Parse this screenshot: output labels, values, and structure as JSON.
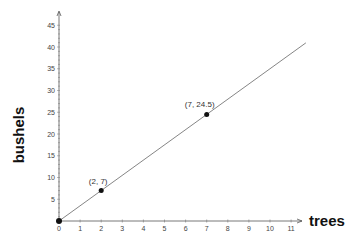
{
  "chart_data": {
    "type": "line",
    "title": "",
    "xlabel": "trees",
    "ylabel": "bushels",
    "xlim": [
      0,
      11.7
    ],
    "ylim": [
      0,
      46
    ],
    "x_ticks": [
      0,
      1,
      2,
      3,
      4,
      5,
      6,
      7,
      8,
      9,
      10,
      11
    ],
    "y_ticks": [
      5,
      10,
      15,
      20,
      25,
      30,
      35,
      40,
      45
    ],
    "grid": false,
    "series": [
      {
        "name": "bushels vs trees",
        "x": [
          0,
          11.7
        ],
        "y": [
          0,
          40.95
        ],
        "slope": 3.5
      }
    ],
    "points": [
      {
        "x": 0,
        "y": 0,
        "label": ""
      },
      {
        "x": 2,
        "y": 7,
        "label": "(2, 7)"
      },
      {
        "x": 7,
        "y": 24.5,
        "label": "(7, 24.5)"
      }
    ]
  }
}
